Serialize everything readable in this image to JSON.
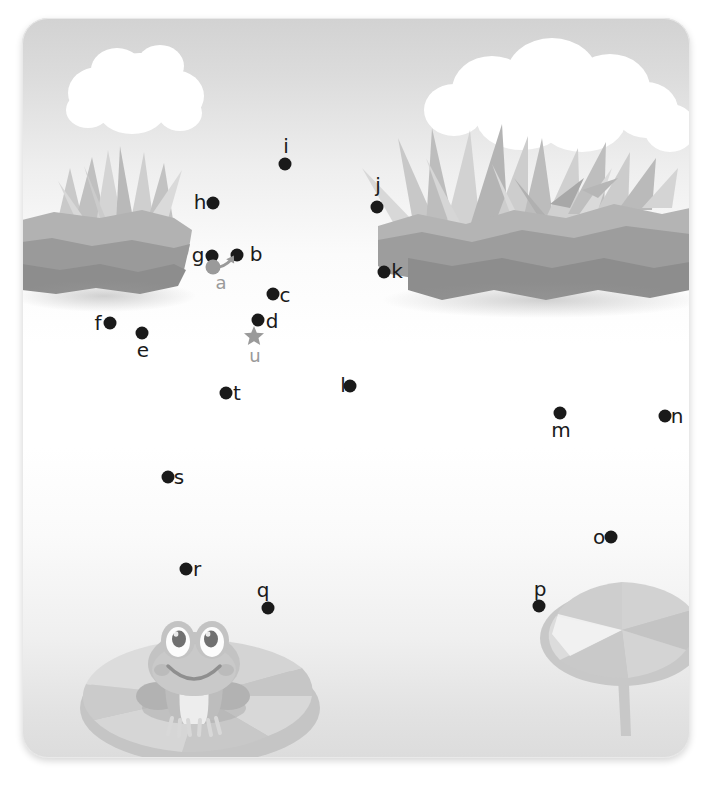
{
  "page": {
    "scene": "pond with frog on lily pad",
    "card": {
      "width": 668,
      "height": 740,
      "corner_radius": 26
    }
  },
  "colors": {
    "dot": "#1a1a1a",
    "label": "#1a1a1a",
    "marker": "#9a9a9a",
    "sky_top": "#d2d2d2",
    "sky_mid": "#ffffff",
    "water_bottom": "#dcdcdc",
    "cloud": "#ffffff",
    "bank_light": "#b4b4b4",
    "bank_dark": "#8e8e8e",
    "grass_light": "#d2d2d2",
    "grass_mid": "#b8b8b8",
    "grass_dark": "#a0a0a0",
    "lilypad_light": "#d8d8d8",
    "lilypad_mid": "#c6c6c6",
    "lilypad_dark": "#b6b6b6",
    "frog_body": "#bfbfbf",
    "frog_dark": "#a8a8a8",
    "frog_eye_white": "#fdfdfd",
    "frog_pupil": "#6e6e6e",
    "frog_belly": "#ececec"
  },
  "markers": {
    "start": {
      "id": "a",
      "label": "a",
      "type": "circle-with-arrow",
      "x": 191,
      "y": 249,
      "label_x": 199,
      "label_y": 265
    },
    "end": {
      "id": "u",
      "label": "u",
      "type": "star",
      "x": 232,
      "y": 320,
      "label_x": 233,
      "label_y": 338
    }
  },
  "dots": [
    {
      "id": "b",
      "label": "b",
      "x": 215,
      "y": 237,
      "label_x": 234,
      "label_y": 236
    },
    {
      "id": "c",
      "label": "c",
      "x": 251,
      "y": 276,
      "label_x": 263,
      "label_y": 277
    },
    {
      "id": "d",
      "label": "d",
      "x": 236,
      "y": 302,
      "label_x": 250,
      "label_y": 303
    },
    {
      "id": "e",
      "label": "e",
      "x": 120,
      "y": 315,
      "label_x": 121,
      "label_y": 332
    },
    {
      "id": "f",
      "label": "f",
      "x": 88,
      "y": 305,
      "label_x": 76,
      "label_y": 305
    },
    {
      "id": "g",
      "label": "g",
      "x": 190,
      "y": 238,
      "label_x": 176,
      "label_y": 237
    },
    {
      "id": "h",
      "label": "h",
      "x": 191,
      "y": 185,
      "label_x": 178,
      "label_y": 184
    },
    {
      "id": "i",
      "label": "i",
      "x": 263,
      "y": 146,
      "label_x": 264,
      "label_y": 128
    },
    {
      "id": "j",
      "label": "j",
      "x": 355,
      "y": 189,
      "label_x": 356,
      "label_y": 167
    },
    {
      "id": "k",
      "label": "k",
      "x": 362,
      "y": 254,
      "label_x": 375,
      "label_y": 253
    },
    {
      "id": "l",
      "label": "l",
      "x": 328,
      "y": 368,
      "label_x": 321,
      "label_y": 367
    },
    {
      "id": "m",
      "label": "m",
      "x": 538,
      "y": 395,
      "label_x": 539,
      "label_y": 412
    },
    {
      "id": "n",
      "label": "n",
      "x": 643,
      "y": 398,
      "label_x": 655,
      "label_y": 398
    },
    {
      "id": "o",
      "label": "o",
      "x": 589,
      "y": 519,
      "label_x": 577,
      "label_y": 519
    },
    {
      "id": "p",
      "label": "p",
      "x": 517,
      "y": 588,
      "label_x": 518,
      "label_y": 571
    },
    {
      "id": "q",
      "label": "q",
      "x": 246,
      "y": 590,
      "label_x": 241,
      "label_y": 572
    },
    {
      "id": "r",
      "label": "r",
      "x": 164,
      "y": 551,
      "label_x": 175,
      "label_y": 551
    },
    {
      "id": "s",
      "label": "s",
      "x": 146,
      "y": 459,
      "label_x": 157,
      "label_y": 459
    },
    {
      "id": "t",
      "label": "t",
      "x": 204,
      "y": 375,
      "label_x": 215,
      "label_y": 375
    }
  ],
  "sequence": [
    "a",
    "b",
    "c",
    "d",
    "e",
    "f",
    "g",
    "h",
    "i",
    "j",
    "k",
    "l",
    "m",
    "n",
    "o",
    "p",
    "q",
    "r",
    "s",
    "t",
    "u"
  ],
  "scenery": {
    "clouds": [
      {
        "name": "cloud-top-left",
        "x": 70,
        "y": 28
      },
      {
        "name": "cloud-top-right",
        "x": 415,
        "y": 45
      }
    ],
    "banks": [
      {
        "name": "bank-left",
        "x": 10,
        "y": 185
      },
      {
        "name": "bank-right",
        "x": 375,
        "y": 160
      }
    ],
    "lilypads": [
      {
        "name": "lilypad-frog",
        "x": 60,
        "y": 615
      },
      {
        "name": "lilypad-right",
        "x": 525,
        "y": 570
      }
    ],
    "frog": {
      "name": "frog",
      "x": 130,
      "y": 608
    }
  }
}
